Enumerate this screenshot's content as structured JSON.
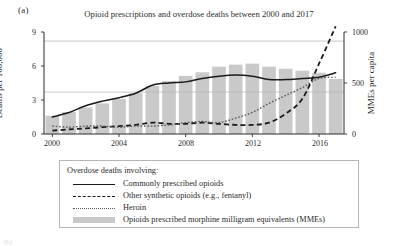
{
  "figure": {
    "panel_label": "(a)",
    "title": "Opioid prescriptions and overdose deaths between 2000 and 2017",
    "next_panel_label": "(b)"
  },
  "axes": {
    "y_left": {
      "label": "Deaths per 100,000",
      "ticks": [
        "0",
        "3",
        "6",
        "9"
      ],
      "min": 0,
      "max": 9
    },
    "y_right": {
      "label": "MMEs per capita",
      "ticks": [
        "0",
        "500",
        "1000"
      ],
      "min": 0,
      "max": 1000
    },
    "x": {
      "ticks": [
        "2000",
        "2004",
        "2008",
        "2012",
        "2016"
      ],
      "min": 2000,
      "max": 2017
    }
  },
  "legend": {
    "title": "Overdose deaths involving:",
    "items": [
      {
        "marker": "solid-line",
        "label": "Commonly prescribed opioids"
      },
      {
        "marker": "dashed-line",
        "label": "Other synthetic opioids (e.g., fentanyl)"
      },
      {
        "marker": "dotted-line",
        "label": "Heroin"
      },
      {
        "marker": "gray-bar",
        "label": "Opioids prescribed morphine milligram equivalents (MMEs)"
      }
    ]
  },
  "colors": {
    "bar": "#c9c9c9",
    "solid_line": "#1a1a1a",
    "dashed_line": "#1a1a1a",
    "dotted_line": "#5a5a5a",
    "gridline": "#b9b9b9",
    "axis": "#2b2b2b"
  },
  "chart_data": {
    "type": "bar",
    "title": "Opioid prescriptions and overdose deaths between 2000 and 2017",
    "xlabel": "",
    "ylabel": "Deaths per 100,000",
    "ylabel_secondary": "MMEs per capita",
    "ylim": [
      0,
      9
    ],
    "ylim_secondary": [
      0,
      1000
    ],
    "xlim": [
      2000,
      2017
    ],
    "grid": true,
    "gridlines_y": [
      3.7,
      8.2
    ],
    "legend_position": "below-plot",
    "categories": [
      2000,
      2001,
      2002,
      2003,
      2004,
      2005,
      2006,
      2007,
      2008,
      2009,
      2010,
      2011,
      2012,
      2013,
      2014,
      2015,
      2016,
      2017
    ],
    "series": [
      {
        "name": "Opioids prescribed morphine milligram equivalents (MMEs)",
        "type": "bar",
        "axis": "right",
        "unit": "MMEs per capita",
        "values": [
          180,
          215,
          260,
          300,
          345,
          400,
          470,
          520,
          570,
          605,
          660,
          680,
          690,
          660,
          640,
          620,
          600,
          540
        ]
      },
      {
        "name": "Commonly prescribed opioids",
        "type": "line",
        "style": "solid",
        "axis": "left",
        "unit": "Deaths per 100,000",
        "values": [
          1.5,
          1.9,
          2.5,
          2.9,
          3.2,
          3.6,
          4.3,
          4.5,
          4.6,
          4.9,
          5.1,
          5.2,
          5.1,
          4.8,
          4.8,
          4.9,
          5.0,
          5.4
        ]
      },
      {
        "name": "Other synthetic opioids (e.g., fentanyl)",
        "type": "line",
        "style": "dashed",
        "axis": "left",
        "unit": "Deaths per 100,000",
        "values": [
          0.3,
          0.4,
          0.5,
          0.6,
          0.7,
          0.8,
          1.0,
          0.9,
          0.9,
          1.0,
          0.9,
          0.8,
          0.8,
          1.0,
          1.8,
          3.1,
          6.2,
          9.5
        ]
      },
      {
        "name": "Heroin",
        "type": "line",
        "style": "dotted",
        "axis": "left",
        "unit": "Deaths per 100,000",
        "values": [
          0.7,
          0.6,
          0.7,
          0.7,
          0.6,
          0.7,
          0.7,
          0.8,
          1.0,
          1.1,
          1.0,
          1.4,
          1.9,
          2.7,
          3.4,
          4.1,
          4.9,
          5.0
        ]
      }
    ]
  }
}
